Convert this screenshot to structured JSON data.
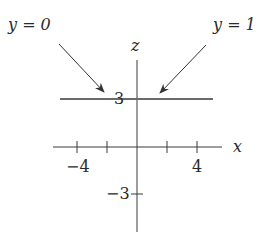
{
  "diagram": {
    "axes": {
      "horizontal_label": "x",
      "vertical_label": "z",
      "x_ticks": [
        -4,
        -2,
        2,
        4
      ],
      "x_tick_labels": [
        "−4",
        "4"
      ],
      "z_tick_labels": [
        "3",
        "−3"
      ]
    },
    "line": {
      "description": "horizontal line z = 3",
      "z_value": 3
    },
    "annotations": [
      {
        "label": "y = 0",
        "points_to": "line z = 3"
      },
      {
        "label": "y = 1",
        "points_to": "line z = 3"
      }
    ],
    "colors": {
      "axis": "#3a3a3a",
      "line": "#6a6a6a",
      "text": "#2a2a2a"
    }
  }
}
